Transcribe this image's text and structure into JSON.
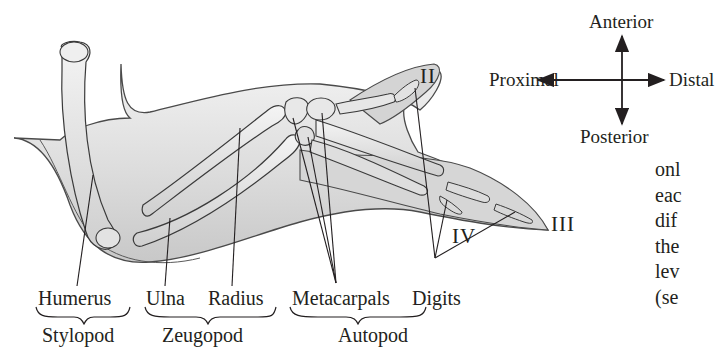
{
  "diagram": {
    "bones": {
      "humerus": "Humerus",
      "ulna": "Ulna",
      "radius": "Radius",
      "metacarpals": "Metacarpals",
      "digits": "Digits"
    },
    "segments": {
      "stylopod": "Stylopod",
      "zeugopod": "Zeugopod",
      "autopod": "Autopod"
    },
    "digit_numerals": {
      "ii": "II",
      "iii": "III",
      "iv": "IV"
    },
    "compass": {
      "up": "Anterior",
      "down": "Posterior",
      "left": "Proximal",
      "right": "Distal"
    },
    "colors": {
      "ink": "#231f20",
      "tissue_fill": "#d9d9d9",
      "tissue_light": "#efefef",
      "bone_fill": "#e6e6e6",
      "bone_outline": "#3a3a3a"
    }
  },
  "body_text_fragment": {
    "lines": [
      "onl",
      "eac",
      "dif",
      "the",
      "lev",
      "(se"
    ]
  }
}
